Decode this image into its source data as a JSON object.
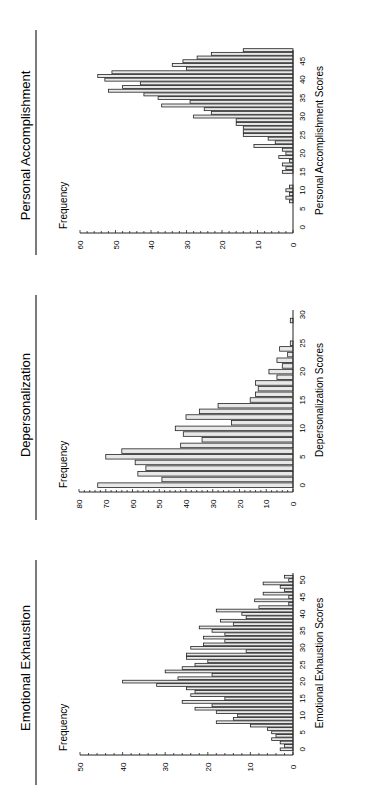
{
  "chart_data": [
    {
      "type": "bar",
      "orientation": "rotated-90-ccw",
      "title": "Personal Accomplishment",
      "xlabel": "Personal Accomplishment Scores",
      "ylabel": "Frequency",
      "ylim": [
        0,
        60
      ],
      "yticks": [
        0,
        10,
        20,
        30,
        40,
        50,
        60
      ],
      "xticks": [
        0,
        5,
        10,
        15,
        20,
        25,
        30,
        35,
        40,
        45
      ],
      "xlim": [
        0,
        48
      ],
      "categories": [
        7,
        8,
        9,
        10,
        11,
        12,
        13,
        14,
        15,
        16,
        17,
        18,
        19,
        20,
        21,
        22,
        23,
        24,
        25,
        26,
        27,
        28,
        29,
        30,
        31,
        32,
        33,
        34,
        35,
        36,
        37,
        38,
        39,
        40,
        41,
        42,
        43,
        44,
        45,
        46,
        47,
        48
      ],
      "values": [
        1,
        2,
        1,
        2,
        1,
        0,
        0,
        0,
        3,
        2,
        3,
        1,
        4,
        2,
        3,
        11,
        5,
        7,
        14,
        14,
        14,
        16,
        16,
        28,
        23,
        25,
        37,
        29,
        38,
        42,
        52,
        48,
        43,
        53,
        55,
        51,
        30,
        34,
        31,
        27,
        23,
        14
      ]
    },
    {
      "type": "bar",
      "orientation": "rotated-90-ccw",
      "title": "Depersonalization",
      "xlabel": "Depersonalization Scores",
      "ylabel": "Frequency",
      "ylim": [
        0,
        80
      ],
      "yticks": [
        0,
        10,
        20,
        30,
        40,
        50,
        60,
        70,
        80
      ],
      "xticks": [
        0,
        5,
        10,
        15,
        20,
        25,
        30
      ],
      "xlim": [
        0,
        31
      ],
      "categories": [
        0,
        1,
        2,
        3,
        4,
        5,
        6,
        7,
        8,
        9,
        10,
        11,
        12,
        13,
        14,
        15,
        16,
        17,
        18,
        19,
        20,
        21,
        22,
        23,
        24,
        25,
        26,
        27,
        28,
        29
      ],
      "values": [
        73,
        49,
        58,
        55,
        59,
        70,
        64,
        42,
        34,
        41,
        44,
        23,
        40,
        35,
        28,
        16,
        14,
        13,
        14,
        6,
        9,
        4,
        6,
        2,
        5,
        1,
        0,
        0,
        0,
        1
      ]
    },
    {
      "type": "bar",
      "orientation": "rotated-90-ccw",
      "title": "Emotional Exhaustion",
      "xlabel": "Emotional Exhaustion Scores",
      "ylabel": "Frequency",
      "ylim": [
        0,
        50
      ],
      "yticks": [
        0,
        10,
        20,
        30,
        40,
        50
      ],
      "xticks": [
        0,
        5,
        10,
        15,
        20,
        25,
        30,
        35,
        40,
        45,
        50
      ],
      "xlim": [
        0,
        52
      ],
      "categories": [
        0,
        1,
        2,
        3,
        4,
        5,
        6,
        7,
        8,
        9,
        10,
        11,
        12,
        13,
        14,
        15,
        16,
        17,
        18,
        19,
        20,
        21,
        22,
        23,
        24,
        25,
        26,
        27,
        28,
        29,
        30,
        31,
        32,
        33,
        34,
        35,
        36,
        37,
        38,
        39,
        40,
        41,
        42,
        43,
        44,
        45,
        46,
        47,
        48,
        49,
        50,
        51
      ],
      "values": [
        3,
        2,
        3,
        5,
        4,
        5,
        6,
        10,
        18,
        14,
        13,
        18,
        23,
        19,
        26,
        16,
        24,
        23,
        25,
        32,
        40,
        27,
        19,
        30,
        26,
        23,
        20,
        25,
        25,
        11,
        24,
        21,
        16,
        21,
        16,
        19,
        22,
        14,
        17,
        11,
        12,
        18,
        8,
        1,
        9,
        1,
        7,
        2,
        3,
        7,
        1,
        2
      ]
    }
  ],
  "panels": [
    {
      "title": "Personal Accomplishment",
      "ylabel": "Frequency",
      "xlabel": "Personal Accomplishment Scores"
    },
    {
      "title": "Depersonalization",
      "ylabel": "Frequency",
      "xlabel": "Depersonalization Scores"
    },
    {
      "title": "Emotional Exhaustion",
      "ylabel": "Frequency",
      "xlabel": "Emotional Exhaustion Scores"
    }
  ]
}
